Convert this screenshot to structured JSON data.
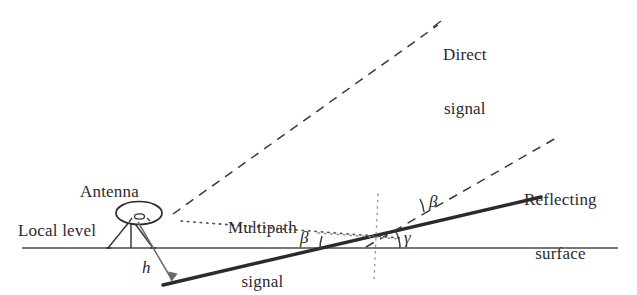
{
  "figure": {
    "background_color": "#ffffff",
    "ink_color": "#2b2b2b",
    "line_color": "#3a3a3a"
  },
  "labels": {
    "antenna": "Antenna",
    "local_level": "Local level",
    "direct_signal_line1": "Direct",
    "direct_signal_line2": "signal",
    "multipath_signal_line1": "Multipath",
    "multipath_signal_line2": "signal",
    "reflecting_surface_line1": "Reflecting",
    "reflecting_surface_line2": "surface",
    "height_symbol": "h",
    "beta_surface": "β",
    "beta_reflect": "β",
    "gamma": "γ"
  },
  "geometry": {
    "local_level": {
      "x1": 22,
      "y1": 248,
      "x2": 618,
      "y2": 248,
      "style": "solid"
    },
    "reflecting_surface": {
      "x1": 163,
      "y1": 285,
      "x2": 541,
      "y2": 197,
      "style": "solid-thick"
    },
    "direct_signal": {
      "x1": 173,
      "y1": 214,
      "x2": 438,
      "y2": 25,
      "style": "dashed"
    },
    "reflected_signal": {
      "x1": 368,
      "y1": 246,
      "x2": 556,
      "y2": 138,
      "style": "dashed"
    },
    "multipath_horizontal": {
      "x1": 181,
      "y1": 222,
      "x2": 398,
      "y2": 237,
      "style": "dotted"
    },
    "vertical_normal": {
      "x": 377,
      "y1": 194,
      "y2": 281,
      "style": "dotted"
    },
    "height_arrow": {
      "x1": 163,
      "y1": 224,
      "x2": 175,
      "y2": 282
    }
  },
  "angles": {
    "beta_surface_value_note": "β between local level and reflecting surface",
    "gamma_value_note": "γ between reflecting surface and reflected ray at reflection point",
    "beta_reflect_value_note": "β between reflected ray and reflecting surface"
  }
}
